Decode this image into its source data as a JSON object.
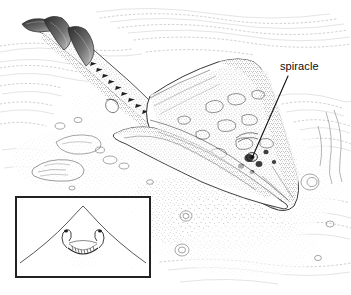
{
  "figure": {
    "style": "pen-and-ink stipple scientific illustration",
    "background_color": "#ffffff",
    "ink_color": "#1a1a1a",
    "width": 351,
    "height": 295
  },
  "labels": [
    {
      "id": "spiracle",
      "text": "spiracle",
      "x": 280,
      "y": 61,
      "leader_line": {
        "from_x": 288,
        "from_y": 76,
        "to_x": 252,
        "to_y": 158
      }
    }
  ],
  "inset": {
    "name": "ventral-snout-detail",
    "x": 16,
    "y": 197,
    "width": 134,
    "height": 80,
    "border_color": "#222222",
    "border_width": 2,
    "background_color": "#ffffff",
    "description": "Ventral view of snout showing mouth and nostrils"
  },
  "subject": {
    "name": "skate",
    "parts": [
      "tail",
      "first-dorsal-fin",
      "second-dorsal-fin",
      "caudal-fin",
      "tail-thorn-row",
      "pectoral-disc",
      "pelvic-fin",
      "snout",
      "spiracle",
      "eye"
    ]
  },
  "scene": {
    "elements": [
      "sand-ripples",
      "stippled-sand",
      "shell-debris",
      "pebbles"
    ]
  }
}
